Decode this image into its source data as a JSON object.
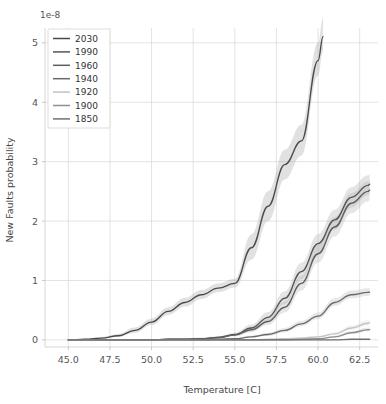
{
  "chart_data": {
    "type": "line",
    "title": "",
    "xlabel": "Temperature [C]",
    "ylabel": "New Faults probability",
    "y_offset_text": "1e-8",
    "y_offset_value": 1e-08,
    "grid": true,
    "legend_position": "upper left",
    "xlim": [
      43.6,
      63.6
    ],
    "ylim": [
      -0.12,
      5.25
    ],
    "xticks": [
      45.0,
      47.5,
      50.0,
      52.5,
      55.0,
      57.5,
      60.0,
      62.5
    ],
    "xtick_labels": [
      "45.0",
      "47.5",
      "50.0",
      "52.5",
      "55.0",
      "57.5",
      "60.0",
      "62.5"
    ],
    "yticks": [
      0,
      1,
      2,
      3,
      4,
      5
    ],
    "ytick_labels": [
      "0",
      "1",
      "2",
      "3",
      "4",
      "5"
    ],
    "x": [
      45.0,
      46.0,
      47.0,
      48.0,
      49.0,
      50.0,
      51.0,
      52.0,
      53.0,
      54.0,
      55.0,
      56.0,
      57.0,
      58.0,
      59.0,
      60.0,
      61.0,
      62.0,
      63.0
    ],
    "series": [
      {
        "name": "2030",
        "color": "#4a4a4a",
        "band_color": "#9a9a9a",
        "x_end": 60.3,
        "values": [
          0.0,
          0.01,
          0.03,
          0.07,
          0.16,
          0.3,
          0.48,
          0.63,
          0.76,
          0.87,
          0.95,
          1.55,
          2.25,
          2.95,
          3.35,
          4.7,
          null,
          null,
          null
        ],
        "band_low": [
          0.0,
          0.0,
          0.02,
          0.05,
          0.12,
          0.25,
          0.42,
          0.56,
          0.69,
          0.8,
          0.88,
          1.35,
          2.0,
          2.7,
          3.1,
          4.45,
          null,
          null,
          null
        ],
        "band_high": [
          0.0,
          0.02,
          0.05,
          0.1,
          0.21,
          0.36,
          0.55,
          0.71,
          0.84,
          0.95,
          1.03,
          1.78,
          2.5,
          3.2,
          3.62,
          5.0,
          null,
          null,
          null
        ]
      },
      {
        "name": "1990",
        "color": "#555555",
        "band_color": "#a5a5a5",
        "x_end": 63.1,
        "values": [
          0.0,
          0.0,
          0.0,
          0.0,
          0.0,
          0.0,
          0.01,
          0.01,
          0.02,
          0.04,
          0.09,
          0.2,
          0.38,
          0.7,
          1.15,
          1.62,
          2.02,
          2.4,
          2.6
        ],
        "band_low": [
          0.0,
          0.0,
          0.0,
          0.0,
          0.0,
          0.0,
          0.0,
          0.01,
          0.02,
          0.03,
          0.07,
          0.16,
          0.31,
          0.6,
          1.02,
          1.47,
          1.86,
          2.23,
          2.44
        ],
        "band_high": [
          0.0,
          0.0,
          0.0,
          0.0,
          0.0,
          0.01,
          0.02,
          0.02,
          0.04,
          0.06,
          0.12,
          0.26,
          0.47,
          0.82,
          1.3,
          1.78,
          2.19,
          2.57,
          2.77
        ]
      },
      {
        "name": "1960",
        "color": "#5f5f5f",
        "band_color": "#ababab",
        "x_end": 63.1,
        "values": [
          0.0,
          0.0,
          0.0,
          0.0,
          0.0,
          0.0,
          0.01,
          0.01,
          0.02,
          0.04,
          0.08,
          0.17,
          0.31,
          0.55,
          0.95,
          1.45,
          1.9,
          2.3,
          2.5
        ],
        "band_low": [
          0.0,
          0.0,
          0.0,
          0.0,
          0.0,
          0.0,
          0.0,
          0.01,
          0.01,
          0.03,
          0.06,
          0.13,
          0.25,
          0.46,
          0.83,
          1.3,
          1.74,
          2.13,
          2.33
        ],
        "band_high": [
          0.0,
          0.0,
          0.0,
          0.0,
          0.0,
          0.01,
          0.01,
          0.02,
          0.03,
          0.05,
          0.1,
          0.22,
          0.38,
          0.65,
          1.08,
          1.61,
          2.07,
          2.47,
          2.67
        ]
      },
      {
        "name": "1940",
        "color": "#6a6a6a",
        "band_color": "#b2b2b2",
        "x_end": 63.1,
        "values": [
          0.0,
          0.0,
          0.0,
          0.0,
          0.0,
          0.0,
          0.0,
          0.0,
          0.0,
          0.01,
          0.02,
          0.05,
          0.09,
          0.16,
          0.27,
          0.4,
          0.63,
          0.76,
          0.8
        ],
        "band_low": [
          0.0,
          0.0,
          0.0,
          0.0,
          0.0,
          0.0,
          0.0,
          0.0,
          0.0,
          0.0,
          0.01,
          0.04,
          0.07,
          0.13,
          0.23,
          0.35,
          0.57,
          0.7,
          0.74
        ],
        "band_high": [
          0.0,
          0.0,
          0.0,
          0.0,
          0.0,
          0.0,
          0.0,
          0.01,
          0.01,
          0.02,
          0.03,
          0.07,
          0.12,
          0.2,
          0.32,
          0.46,
          0.7,
          0.83,
          0.87
        ]
      },
      {
        "name": "1920",
        "color": "#c2c2c2",
        "band_color": "#d8d8d8",
        "x_end": 63.1,
        "values": [
          0.0,
          0.0,
          0.0,
          0.0,
          0.0,
          0.0,
          0.0,
          0.0,
          0.0,
          0.0,
          0.0,
          0.0,
          0.01,
          0.02,
          0.03,
          0.05,
          0.1,
          0.2,
          0.28
        ],
        "band_low": [
          0.0,
          0.0,
          0.0,
          0.0,
          0.0,
          0.0,
          0.0,
          0.0,
          0.0,
          0.0,
          0.0,
          0.0,
          0.0,
          0.01,
          0.02,
          0.04,
          0.08,
          0.17,
          0.24
        ],
        "band_high": [
          0.0,
          0.0,
          0.0,
          0.0,
          0.0,
          0.0,
          0.0,
          0.0,
          0.0,
          0.0,
          0.01,
          0.01,
          0.02,
          0.03,
          0.05,
          0.07,
          0.13,
          0.24,
          0.33
        ]
      },
      {
        "name": "1900",
        "color": "#8f8f8f",
        "band_color": "#c4c4c4",
        "x_end": 63.1,
        "values": [
          0.0,
          0.0,
          0.0,
          0.0,
          0.0,
          0.0,
          0.0,
          0.0,
          0.0,
          0.0,
          0.0,
          0.0,
          0.0,
          0.0,
          0.01,
          0.02,
          0.05,
          0.12,
          0.17
        ],
        "band_low": [
          0.0,
          0.0,
          0.0,
          0.0,
          0.0,
          0.0,
          0.0,
          0.0,
          0.0,
          0.0,
          0.0,
          0.0,
          0.0,
          0.0,
          0.0,
          0.01,
          0.04,
          0.1,
          0.14
        ],
        "band_high": [
          0.0,
          0.0,
          0.0,
          0.0,
          0.0,
          0.0,
          0.0,
          0.0,
          0.0,
          0.0,
          0.0,
          0.0,
          0.01,
          0.01,
          0.02,
          0.03,
          0.07,
          0.15,
          0.21
        ]
      },
      {
        "name": "1850",
        "color": "#707070",
        "band_color": "#b8b8b8",
        "x_end": 63.1,
        "values": [
          0.0,
          0.0,
          0.0,
          0.0,
          0.0,
          0.0,
          0.0,
          0.0,
          0.0,
          0.0,
          0.0,
          0.0,
          0.0,
          0.0,
          0.0,
          0.0,
          0.0,
          0.01,
          0.01
        ],
        "band_low": [
          0.0,
          0.0,
          0.0,
          0.0,
          0.0,
          0.0,
          0.0,
          0.0,
          0.0,
          0.0,
          0.0,
          0.0,
          0.0,
          0.0,
          0.0,
          0.0,
          0.0,
          0.0,
          0.0
        ],
        "band_high": [
          0.0,
          0.0,
          0.0,
          0.0,
          0.0,
          0.0,
          0.0,
          0.0,
          0.0,
          0.0,
          0.0,
          0.0,
          0.0,
          0.0,
          0.01,
          0.01,
          0.01,
          0.02,
          0.02
        ]
      }
    ]
  },
  "legend": {
    "entries": [
      "2030",
      "1990",
      "1960",
      "1940",
      "1920",
      "1900",
      "1850"
    ]
  }
}
